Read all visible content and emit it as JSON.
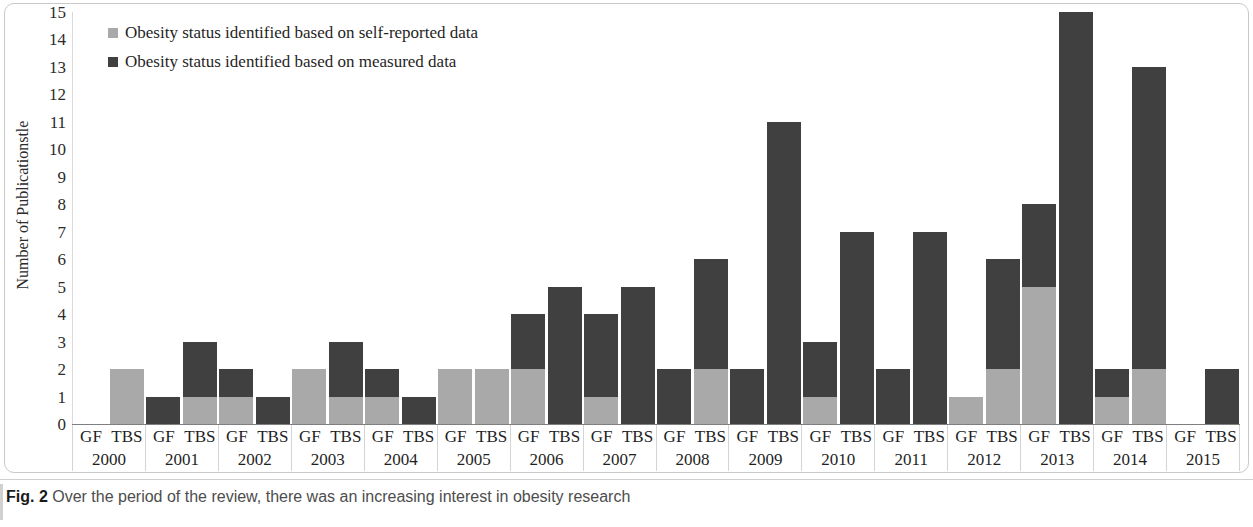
{
  "figure": {
    "caption_label": "Fig. 2",
    "caption_text": "Over the period of the review, there was an increasing interest in obesity research"
  },
  "axes": {
    "ylabel": "Number of Publicationstle",
    "yticks": [
      "15",
      "14",
      "13",
      "12",
      "11",
      "10",
      "9",
      "8",
      "7",
      "6",
      "5",
      "4",
      "3",
      "2",
      "1",
      "0"
    ]
  },
  "legend": {
    "items": [
      {
        "label": "Obesity status identified based on self-reported data",
        "color": "#a9a9a9",
        "key": "self_reported"
      },
      {
        "label": "Obesity status identified based on measured data",
        "color": "#404040",
        "key": "measured"
      }
    ]
  },
  "colors": {
    "self_reported": "#a9a9a9",
    "measured": "#404040",
    "axis": "#7f7f7f",
    "gridline": "#d9d9d9",
    "frame": "#c9c9c9"
  },
  "chart_data": {
    "type": "bar",
    "title": "",
    "subtitle": "",
    "xlabel": "",
    "ylabel": "Number of Publicationstle",
    "ylim": [
      0,
      15
    ],
    "ytick_step": 1,
    "grid": false,
    "stacked": true,
    "legend_position": "top-left",
    "group_labels": [
      "GF",
      "TBS"
    ],
    "categories": [
      "2000",
      "2001",
      "2002",
      "2003",
      "2004",
      "2005",
      "2006",
      "2007",
      "2008",
      "2009",
      "2010",
      "2011",
      "2012",
      "2013",
      "2014",
      "2015"
    ],
    "series": [
      {
        "name": "Obesity status identified based on self-reported data",
        "color": "#a9a9a9",
        "GF": [
          0,
          0,
          1,
          2,
          1,
          2,
          2,
          1,
          0,
          0,
          1,
          0,
          1,
          5,
          1,
          0
        ],
        "TBS": [
          2,
          1,
          0,
          1,
          0,
          2,
          0,
          0,
          2,
          0,
          0,
          0,
          2,
          0,
          2,
          0
        ]
      },
      {
        "name": "Obesity status identified based on measured data",
        "color": "#404040",
        "GF": [
          0,
          1,
          1,
          0,
          1,
          0,
          2,
          3,
          2,
          2,
          2,
          2,
          0,
          3,
          1,
          0
        ],
        "TBS": [
          0,
          2,
          1,
          2,
          1,
          0,
          5,
          5,
          4,
          11,
          7,
          7,
          4,
          15,
          11,
          2
        ]
      }
    ],
    "totals": {
      "GF": [
        0,
        1,
        2,
        2,
        2,
        2,
        4,
        4,
        2,
        2,
        3,
        2,
        1,
        8,
        2,
        0
      ],
      "TBS": [
        2,
        3,
        1,
        3,
        1,
        2,
        5,
        5,
        6,
        11,
        7,
        7,
        6,
        15,
        13,
        2
      ]
    }
  }
}
